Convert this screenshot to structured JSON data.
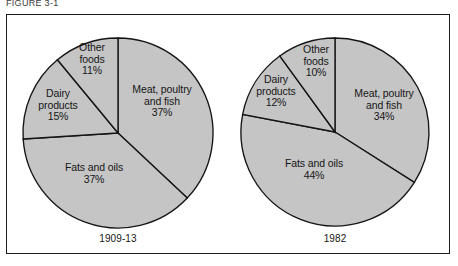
{
  "figure": {
    "top_caption": "FIGURE 3-1",
    "background_color": "#ffffff",
    "frame_color": "#1c1c1c",
    "slice_fill_color": "#c5c5c5",
    "slice_outline_color": "#141414"
  },
  "chart_data": [
    {
      "type": "pie",
      "title": "1909-13",
      "categories": [
        "Meat, poultry and fish",
        "Fats and oils",
        "Dairy products",
        "Other foods"
      ],
      "values": [
        37,
        37,
        15,
        11
      ],
      "value_suffix": "%",
      "start_angle_deg": 0,
      "direction": "clockwise",
      "legend": "none",
      "labels": [
        {
          "name": "Meat, poultry\nand fish",
          "value": "37%"
        },
        {
          "name": "Fats and oils",
          "value": "37%"
        },
        {
          "name": "Dairy\nproducts",
          "value": "15%"
        },
        {
          "name": "Other\nfoods",
          "value": "11%"
        }
      ]
    },
    {
      "type": "pie",
      "title": "1982",
      "categories": [
        "Meat, poultry and fish",
        "Fats and oils",
        "Dairy products",
        "Other foods"
      ],
      "values": [
        34,
        44,
        12,
        10
      ],
      "value_suffix": "%",
      "start_angle_deg": 0,
      "direction": "clockwise",
      "legend": "none",
      "labels": [
        {
          "name": "Meat, poultry\nand fish",
          "value": "34%"
        },
        {
          "name": "Fats and oils",
          "value": "44%"
        },
        {
          "name": "Dairy\nproducts",
          "value": "12%"
        },
        {
          "name": "Other\nfoods",
          "value": "10%"
        }
      ]
    }
  ],
  "left_pie": {
    "caption": "1909-13",
    "labels": {
      "meat": "Meat, poultry\nand fish\n37%",
      "fats": "Fats and oils\n37%",
      "dairy": "Dairy\nproducts\n15%",
      "other": "Other\nfoods\n11%"
    }
  },
  "right_pie": {
    "caption": "1982",
    "labels": {
      "meat": "Meat, poultry\nand fish\n34%",
      "fats": "Fats and oils\n44%",
      "dairy": "Dairy\nproducts\n12%",
      "other": "Other\nfoods\n10%"
    }
  }
}
